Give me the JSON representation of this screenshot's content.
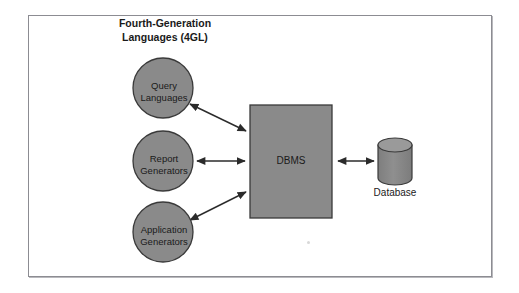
{
  "diagram": {
    "title_line1": "Fourth-Generation",
    "title_line2": "Languages (4GL)",
    "colors": {
      "shape_fill": "#8a8a8a",
      "shape_stroke": "#3a3a3a",
      "arrow": "#2b2b2b",
      "frame_border": "#8c8c92",
      "background": "#ffffff",
      "text": "#1a1a1a"
    },
    "nodes": [
      {
        "id": "query-languages",
        "shape": "circle",
        "label_line1": "Query",
        "label_line2": "Languages",
        "cx": 163,
        "cy": 88,
        "r": 30
      },
      {
        "id": "report-generators",
        "shape": "circle",
        "label_line1": "Report",
        "label_line2": "Generators",
        "cx": 163,
        "cy": 161,
        "r": 30
      },
      {
        "id": "application-generators",
        "shape": "circle",
        "label_line1": "Application",
        "label_line2": "Generators",
        "cx": 163,
        "cy": 232,
        "r": 30
      },
      {
        "id": "dbms",
        "shape": "rectangle",
        "label": "DBMS",
        "x": 250,
        "y": 105,
        "width": 82,
        "height": 113
      },
      {
        "id": "database",
        "shape": "cylinder",
        "label": "Database",
        "x": 378,
        "y": 138,
        "width": 34,
        "height": 47
      }
    ],
    "connections": [
      {
        "id": "query-to-dbms",
        "from": "query-languages",
        "to": "dbms",
        "style": "double-arrow",
        "x1": 189,
        "y1": 103,
        "x2": 246,
        "y2": 131
      },
      {
        "id": "report-to-dbms",
        "from": "report-generators",
        "to": "dbms",
        "style": "double-arrow",
        "x1": 196,
        "y1": 161,
        "x2": 246,
        "y2": 161
      },
      {
        "id": "application-to-dbms",
        "from": "application-generators",
        "to": "dbms",
        "style": "double-arrow",
        "x1": 189,
        "y1": 221,
        "x2": 246,
        "y2": 193
      },
      {
        "id": "dbms-to-database",
        "from": "dbms",
        "to": "database",
        "style": "double-arrow",
        "x1": 336,
        "y1": 161,
        "x2": 374,
        "y2": 161
      }
    ]
  }
}
